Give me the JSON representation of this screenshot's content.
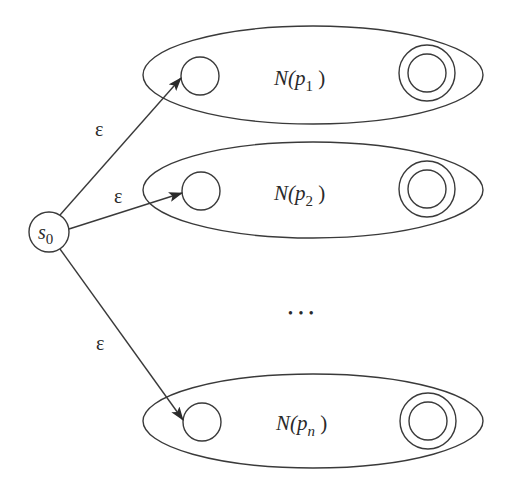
{
  "diagram": {
    "type": "nfa-union-construction",
    "start_state": {
      "label_base": "s",
      "label_sub": "0"
    },
    "transitions": [
      {
        "label": "ε",
        "to": "N(p1)"
      },
      {
        "label": "ε",
        "to": "N(p2)"
      },
      {
        "label": "ε",
        "to": "N(pn)"
      }
    ],
    "subautomata": [
      {
        "name_prefix": "N(",
        "var": "p",
        "sub": "1",
        "suffix": " )"
      },
      {
        "name_prefix": "N(",
        "var": "p",
        "sub": "2",
        "suffix": " )"
      },
      {
        "name_prefix": "N(",
        "var": "p",
        "sub": "n",
        "suffix": " )"
      }
    ],
    "ellipsis": "• • •",
    "colors": {
      "stroke": "#3a3a3a",
      "text": "#2a2a2a",
      "background": "#ffffff"
    }
  }
}
